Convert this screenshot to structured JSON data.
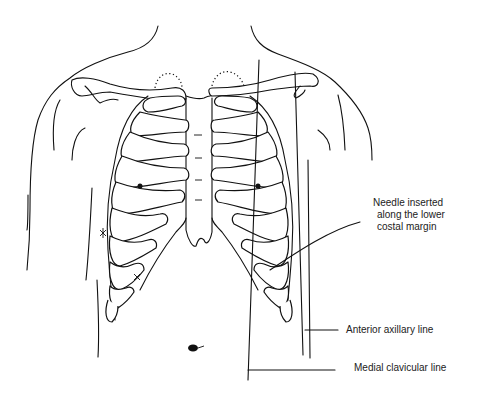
{
  "figure": {
    "labels": {
      "needle": [
        "Needle inserted",
        "along the lower",
        "costal margin"
      ],
      "anterior_axillary": "Anterior axillary line",
      "medial_clavicular": "Medial clavicular line"
    },
    "colors": {
      "stroke": "#111111",
      "background": "#ffffff",
      "text": "#222222"
    }
  }
}
